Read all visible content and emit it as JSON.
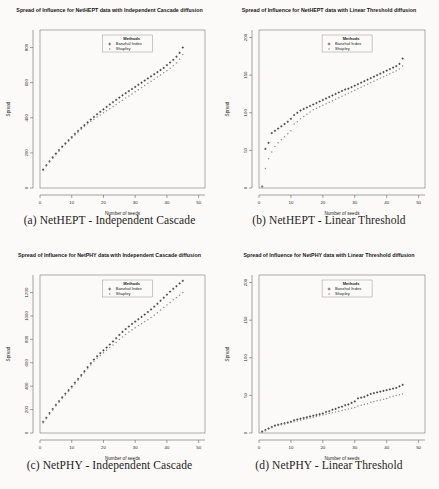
{
  "figure": {
    "background": "#fbfaf8",
    "panels": [
      {
        "id": "panel-a",
        "caption": "(a) NetHEPT - Independent Cascade",
        "title": "Spread of Influence for NetHEPT data with Independent Cascade diffusion",
        "legend": {
          "header": "Methods",
          "items": [
            "Banzhaf Index",
            "Shapley"
          ]
        },
        "xlabel_line1": "Number of seeds",
        "xlabel_line2": "Banzhaf Index vs Shapley Value",
        "ylabel": "Spread"
      },
      {
        "id": "panel-b",
        "caption": "(b) NetHEPT - Linear Threshold",
        "title": "Spread of Influence for NetHEPT data with Linear Threshold diffusion",
        "legend": {
          "header": "Methods",
          "items": [
            "Banzhaf Index",
            "Shapley"
          ]
        },
        "xlabel_line1": "Number of seeds",
        "xlabel_line2": "Banzhaf Index vs Shapley Value",
        "ylabel": "Spread"
      },
      {
        "id": "panel-c",
        "caption": "(c) NetPHY - Independent Cascade",
        "title": "Spread of Influence for NetPHY data with Independent Cascade diffusion",
        "legend": {
          "header": "Methods",
          "items": [
            "Banzhaf Index",
            "Shapley"
          ]
        },
        "xlabel_line1": "Number of seeds",
        "xlabel_line2": "Banzhaf Index vs Shapley Value",
        "ylabel": "Spread"
      },
      {
        "id": "panel-d",
        "caption": "(d) NetPHY - Linear Threshold",
        "title": "Spread of Influence for NetPHY data with Linear Threshold diffusion",
        "legend": {
          "header": "Methods",
          "items": [
            "Banzhaf Index",
            "Shapley"
          ]
        },
        "xlabel_line1": "Number of seeds",
        "xlabel_line2": "Banzhaf Index vs Shapley Value",
        "ylabel": "Spread"
      }
    ]
  },
  "chart_data": [
    {
      "type": "scatter",
      "title": "Spread of Influence for NetHEPT data with Independent Cascade diffusion",
      "xlabel": "Number of seeds",
      "xlabel_sub": "Banzhaf Index vs Shapley Value",
      "ylabel": "Spread",
      "xlim": [
        0,
        52
      ],
      "ylim": [
        0,
        900
      ],
      "xticks": [
        0,
        10,
        20,
        30,
        40,
        50
      ],
      "yticks": [
        0,
        200,
        400,
        600,
        800
      ],
      "grid": false,
      "legend_position": "top-center",
      "series": [
        {
          "name": "Banzhaf Index",
          "marker": "plus",
          "color": "#2a2a2c",
          "x": [
            1,
            2,
            3,
            4,
            5,
            6,
            7,
            8,
            9,
            10,
            11,
            12,
            13,
            14,
            15,
            16,
            17,
            18,
            19,
            20,
            21,
            22,
            23,
            24,
            25,
            26,
            27,
            28,
            29,
            30,
            31,
            32,
            33,
            34,
            35,
            36,
            37,
            38,
            39,
            40,
            41,
            42,
            43,
            44,
            45
          ],
          "y": [
            105,
            130,
            152,
            175,
            196,
            216,
            236,
            254,
            272,
            290,
            308,
            325,
            342,
            358,
            374,
            390,
            405,
            420,
            434,
            448,
            462,
            476,
            489,
            502,
            515,
            528,
            540,
            552,
            564,
            576,
            588,
            600,
            612,
            624,
            636,
            648,
            660,
            672,
            684,
            700,
            715,
            730,
            748,
            770,
            800
          ]
        },
        {
          "name": "Shapley",
          "marker": "dot",
          "color": "#8e8d8f",
          "x": [
            1,
            2,
            3,
            4,
            5,
            6,
            7,
            8,
            9,
            10,
            11,
            12,
            13,
            14,
            15,
            16,
            17,
            18,
            19,
            20,
            21,
            22,
            23,
            24,
            25,
            26,
            27,
            28,
            29,
            30,
            31,
            32,
            33,
            34,
            35,
            36,
            37,
            38,
            39,
            40,
            41,
            42,
            43,
            44,
            45
          ],
          "y": [
            100,
            126,
            148,
            170,
            190,
            210,
            230,
            248,
            266,
            284,
            302,
            318,
            334,
            350,
            366,
            380,
            392,
            404,
            416,
            428,
            440,
            452,
            464,
            476,
            488,
            500,
            512,
            524,
            536,
            548,
            560,
            572,
            584,
            596,
            608,
            620,
            632,
            644,
            656,
            668,
            682,
            696,
            712,
            734,
            760
          ]
        }
      ]
    },
    {
      "type": "scatter",
      "title": "Spread of Influence for NetHEPT data with Linear Threshold diffusion",
      "xlabel": "Number of seeds",
      "xlabel_sub": "Banzhaf Index vs Shapley Value",
      "ylabel": "Spread",
      "xlim": [
        0,
        52
      ],
      "ylim": [
        0,
        210
      ],
      "xticks": [
        0,
        10,
        20,
        30,
        40,
        50
      ],
      "yticks": [
        0,
        50,
        100,
        150,
        200
      ],
      "grid": false,
      "legend_position": "top-center",
      "series": [
        {
          "name": "Banzhaf Index",
          "marker": "plus",
          "color": "#2a2a2c",
          "x": [
            1,
            2,
            3,
            4,
            5,
            6,
            7,
            8,
            9,
            10,
            11,
            12,
            13,
            14,
            15,
            16,
            17,
            18,
            19,
            20,
            21,
            22,
            23,
            24,
            25,
            26,
            27,
            28,
            29,
            30,
            31,
            32,
            33,
            34,
            35,
            36,
            37,
            38,
            39,
            40,
            41,
            42,
            43,
            44,
            45
          ],
          "y": [
            2,
            52,
            60,
            73,
            76,
            79,
            82,
            85,
            88,
            92,
            97,
            100,
            103,
            105,
            107,
            109,
            111,
            113,
            115,
            117,
            119,
            121,
            123,
            125,
            127,
            129,
            131,
            132,
            134,
            136,
            138,
            140,
            142,
            144,
            146,
            148,
            150,
            152,
            154,
            156,
            158,
            160,
            162,
            165,
            172
          ]
        },
        {
          "name": "Shapley",
          "marker": "dot",
          "color": "#8e8d8f",
          "x": [
            1,
            2,
            3,
            4,
            5,
            6,
            7,
            8,
            9,
            10,
            11,
            12,
            13,
            14,
            15,
            16,
            17,
            18,
            19,
            20,
            21,
            22,
            23,
            24,
            25,
            26,
            27,
            28,
            29,
            30,
            31,
            32,
            33,
            34,
            35,
            36,
            37,
            38,
            39,
            40,
            41,
            42,
            43,
            44,
            45
          ],
          "y": [
            2,
            26,
            39,
            48,
            55,
            60,
            64,
            68,
            72,
            76,
            85,
            88,
            92,
            95,
            98,
            101,
            104,
            106,
            108,
            110,
            112,
            114,
            116,
            118,
            120,
            122,
            124,
            126,
            128,
            130,
            132,
            134,
            136,
            138,
            140,
            142,
            144,
            146,
            148,
            150,
            152,
            154,
            156,
            158,
            162
          ]
        }
      ]
    },
    {
      "type": "scatter",
      "title": "Spread of Influence for NetPHY data with Independent Cascade diffusion",
      "xlabel": "Number of seeds",
      "xlabel_sub": "Banzhaf Index vs Shapley Value",
      "ylabel": "Spread",
      "xlim": [
        0,
        52
      ],
      "ylim": [
        0,
        1350
      ],
      "xticks": [
        0,
        10,
        20,
        30,
        40,
        50
      ],
      "yticks": [
        0,
        200,
        400,
        600,
        800,
        1000,
        1200
      ],
      "grid": false,
      "legend_position": "top-center",
      "series": [
        {
          "name": "Banzhaf Index",
          "marker": "plus",
          "color": "#2a2a2c",
          "x": [
            1,
            2,
            3,
            4,
            5,
            6,
            7,
            8,
            9,
            10,
            11,
            12,
            13,
            14,
            15,
            16,
            17,
            18,
            19,
            20,
            21,
            22,
            23,
            24,
            25,
            26,
            27,
            28,
            29,
            30,
            31,
            32,
            33,
            34,
            35,
            36,
            37,
            38,
            39,
            40,
            41,
            42,
            43,
            44,
            45
          ],
          "y": [
            95,
            130,
            170,
            205,
            240,
            272,
            305,
            336,
            366,
            396,
            430,
            462,
            495,
            528,
            562,
            596,
            628,
            656,
            682,
            706,
            730,
            756,
            782,
            810,
            838,
            864,
            888,
            910,
            932,
            952,
            972,
            992,
            1012,
            1034,
            1056,
            1080,
            1104,
            1130,
            1156,
            1182,
            1208,
            1232,
            1254,
            1278,
            1300
          ]
        },
        {
          "name": "Shapley",
          "marker": "dot",
          "color": "#8e8d8f",
          "x": [
            1,
            2,
            3,
            4,
            5,
            6,
            7,
            8,
            9,
            10,
            11,
            12,
            13,
            14,
            15,
            16,
            17,
            18,
            19,
            20,
            21,
            22,
            23,
            24,
            25,
            26,
            27,
            28,
            29,
            30,
            31,
            32,
            33,
            34,
            35,
            36,
            37,
            38,
            39,
            40,
            41,
            42,
            43,
            44,
            45
          ],
          "y": [
            88,
            122,
            160,
            196,
            230,
            262,
            294,
            324,
            354,
            384,
            418,
            450,
            482,
            514,
            548,
            580,
            612,
            638,
            662,
            686,
            708,
            730,
            752,
            774,
            798,
            820,
            842,
            862,
            882,
            900,
            918,
            934,
            950,
            968,
            986,
            1006,
            1028,
            1050,
            1072,
            1094,
            1116,
            1138,
            1158,
            1178,
            1200
          ]
        }
      ]
    },
    {
      "type": "scatter",
      "title": "Spread of Influence for NetPHY data with Linear Threshold diffusion",
      "xlabel": "Number of seeds",
      "xlabel_sub": "Banzhaf Index vs Shapley Value",
      "ylabel": "Spread",
      "xlim": [
        0,
        52
      ],
      "ylim": [
        0,
        210
      ],
      "xticks": [
        0,
        10,
        20,
        30,
        40,
        50
      ],
      "yticks": [
        0,
        50,
        100,
        150,
        200
      ],
      "grid": false,
      "legend_position": "top-center",
      "series": [
        {
          "name": "Banzhaf Index",
          "marker": "plus",
          "color": "#2a2a2c",
          "x": [
            1,
            2,
            3,
            4,
            5,
            6,
            7,
            8,
            9,
            10,
            11,
            12,
            13,
            14,
            15,
            16,
            17,
            18,
            19,
            20,
            21,
            22,
            23,
            24,
            25,
            26,
            27,
            28,
            29,
            30,
            31,
            32,
            33,
            34,
            35,
            36,
            37,
            38,
            39,
            40,
            41,
            42,
            43,
            44,
            45
          ],
          "y": [
            2,
            4,
            6,
            8,
            10,
            11,
            12,
            13,
            14,
            15,
            17,
            18,
            19,
            20,
            21,
            22,
            23,
            24,
            25,
            26,
            28,
            29,
            31,
            32,
            34,
            35,
            37,
            38,
            40,
            42,
            46,
            47,
            48,
            50,
            52,
            53,
            54,
            55,
            56,
            57,
            58,
            59,
            60,
            62,
            64
          ]
        },
        {
          "name": "Shapley",
          "marker": "dot",
          "color": "#8e8d8f",
          "x": [
            1,
            2,
            3,
            4,
            5,
            6,
            7,
            8,
            9,
            10,
            11,
            12,
            13,
            14,
            15,
            16,
            17,
            18,
            19,
            20,
            21,
            22,
            23,
            24,
            25,
            26,
            27,
            28,
            29,
            30,
            31,
            32,
            33,
            34,
            35,
            36,
            37,
            38,
            39,
            40,
            41,
            42,
            43,
            44,
            45
          ],
          "y": [
            1,
            3,
            5,
            7,
            9,
            10,
            11,
            12,
            13,
            14,
            15,
            16,
            17,
            18,
            19,
            20,
            21,
            22,
            23,
            24,
            25,
            26,
            27,
            28,
            29,
            30,
            31,
            32,
            33,
            34,
            36,
            37,
            38,
            39,
            41,
            42,
            43,
            44,
            45,
            46,
            48,
            49,
            50,
            51,
            52
          ]
        }
      ]
    }
  ]
}
